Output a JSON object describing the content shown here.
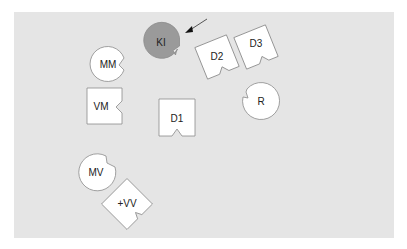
{
  "diagram": {
    "background_color": "#e5e5e5",
    "shapes": [
      {
        "id": "KI",
        "label": "KI",
        "type": "notched-circle",
        "fill": "#9a9a9a",
        "highlighted": true
      },
      {
        "id": "D2",
        "label": "D2",
        "type": "notched-square",
        "fill": "#ffffff"
      },
      {
        "id": "D3",
        "label": "D3",
        "type": "notched-square",
        "fill": "#ffffff"
      },
      {
        "id": "MM",
        "label": "MM",
        "type": "notched-circle",
        "fill": "#ffffff"
      },
      {
        "id": "VM",
        "label": "VM",
        "type": "notched-square",
        "fill": "#ffffff"
      },
      {
        "id": "D1",
        "label": "D1",
        "type": "notched-square",
        "fill": "#ffffff"
      },
      {
        "id": "R",
        "label": "R",
        "type": "notched-circle",
        "fill": "#ffffff"
      },
      {
        "id": "MV",
        "label": "MV",
        "type": "notched-circle",
        "fill": "#ffffff"
      },
      {
        "id": "VV",
        "label": "+VV",
        "type": "notched-square",
        "fill": "#ffffff"
      }
    ],
    "arrow": {
      "points_to": "KI",
      "color": "#333333"
    }
  }
}
